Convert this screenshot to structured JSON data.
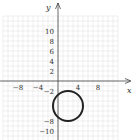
{
  "chart_data": {
    "type": "scatter",
    "title": "",
    "xlabel": "x",
    "ylabel": "y",
    "x_ticks": [
      -8,
      -4,
      4,
      8
    ],
    "y_ticks": [
      10,
      8,
      6,
      4,
      2,
      -2,
      -8,
      -10
    ],
    "xlim": [
      -11,
      12
    ],
    "ylim": [
      -12,
      13
    ],
    "grid": true,
    "grid_step": 1,
    "shapes": [
      {
        "kind": "circle",
        "center": [
          2,
          -5
        ],
        "radius": 3,
        "stroke": "#222222",
        "stroke_width": 2
      }
    ]
  },
  "colors": {
    "axis": "#444444",
    "grid": "#e4e4e4",
    "curve": "#222222"
  },
  "layout": {
    "origin_px": [
      58,
      81
    ],
    "px_per_unit": 5
  }
}
